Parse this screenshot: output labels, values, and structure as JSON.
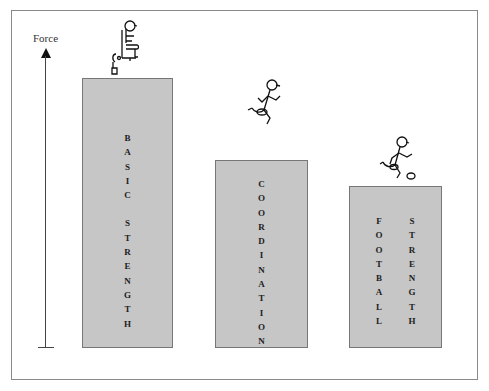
{
  "diagram": {
    "axis": {
      "label": "Force",
      "direction": "up-arrow"
    },
    "bars": [
      {
        "id": "basic-strength",
        "words": [
          "BASIC",
          "STRENGTH"
        ],
        "layout": "single-column",
        "relative_height": 1.0,
        "figure": "stick-figure-seated-leg-extension"
      },
      {
        "id": "coordination",
        "words": [
          "COORDINATION"
        ],
        "layout": "single-column",
        "relative_height": 0.7,
        "figure": "stick-figure-running"
      },
      {
        "id": "football-strength",
        "words": [
          "FOOTBALL",
          "STRENGTH"
        ],
        "layout": "two-columns",
        "relative_height": 0.6,
        "figure": "stick-figure-kicking-ball"
      }
    ],
    "colors": {
      "bar_fill": "#c6c6c6",
      "bar_border": "#777777",
      "frame": "#8a8a8a",
      "text": "#222222"
    }
  }
}
